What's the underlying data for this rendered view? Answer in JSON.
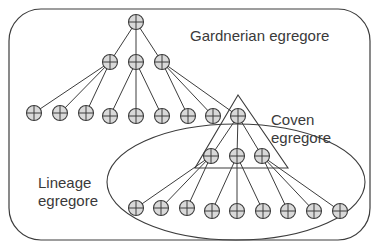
{
  "diagram": {
    "type": "nested-egregore-tree",
    "colors": {
      "stroke": "#3c3c3c",
      "node_fill": "#d9d9d9",
      "text": "#3a3a3a",
      "background": "#ffffff"
    },
    "labels": {
      "gardnerian": "Gardnerian egregore",
      "coven_line1": "Coven",
      "coven_line2": "egregore",
      "lineage_line1": "Lineage",
      "lineage_line2": "egregore"
    },
    "node_icon": "circle-plus-icon",
    "outer_box": {
      "x": 9,
      "y": 9,
      "width": 361,
      "height": 231,
      "radius": 32
    },
    "coven_triangle": {
      "apex": [
        238,
        95
      ],
      "base_left": [
        195,
        168
      ],
      "base_right": [
        288,
        168
      ]
    },
    "lineage_ellipse": {
      "cx": 236,
      "cy": 182,
      "rx": 129,
      "ry": 58
    },
    "nodes": [
      {
        "id": "root",
        "x": 136,
        "y": 22
      },
      {
        "id": "l1a",
        "x": 110,
        "y": 62
      },
      {
        "id": "l1b",
        "x": 136,
        "y": 62
      },
      {
        "id": "l1c",
        "x": 162,
        "y": 62
      },
      {
        "id": "l2a",
        "x": 34,
        "y": 113
      },
      {
        "id": "l2b",
        "x": 60,
        "y": 113
      },
      {
        "id": "l2c",
        "x": 86,
        "y": 113
      },
      {
        "id": "l2d",
        "x": 110,
        "y": 116
      },
      {
        "id": "l2e",
        "x": 136,
        "y": 116
      },
      {
        "id": "l2f",
        "x": 162,
        "y": 116
      },
      {
        "id": "l2g",
        "x": 188,
        "y": 116
      },
      {
        "id": "l2h",
        "x": 213,
        "y": 116
      },
      {
        "id": "coven_root",
        "x": 238,
        "y": 116
      },
      {
        "id": "c1",
        "x": 211,
        "y": 156
      },
      {
        "id": "c2",
        "x": 237,
        "y": 156
      },
      {
        "id": "c3",
        "x": 262,
        "y": 156
      },
      {
        "id": "n1",
        "x": 136,
        "y": 208
      },
      {
        "id": "n2",
        "x": 161,
        "y": 208
      },
      {
        "id": "n3",
        "x": 187,
        "y": 208
      },
      {
        "id": "n4",
        "x": 212,
        "y": 211
      },
      {
        "id": "n5",
        "x": 237,
        "y": 211
      },
      {
        "id": "n6",
        "x": 263,
        "y": 211
      },
      {
        "id": "n7",
        "x": 288,
        "y": 211
      },
      {
        "id": "n8",
        "x": 314,
        "y": 211
      },
      {
        "id": "n9",
        "x": 340,
        "y": 211
      }
    ],
    "edges": [
      [
        "root",
        "l1a"
      ],
      [
        "root",
        "l1b"
      ],
      [
        "root",
        "l1c"
      ],
      [
        "l1a",
        "l2a"
      ],
      [
        "l1a",
        "l2b"
      ],
      [
        "l1a",
        "l2c"
      ],
      [
        "l1b",
        "l2d"
      ],
      [
        "l1b",
        "l2e"
      ],
      [
        "l1b",
        "l2f"
      ],
      [
        "l1c",
        "l2g"
      ],
      [
        "l1c",
        "l2h"
      ],
      [
        "l1c",
        "coven_root"
      ],
      [
        "coven_root",
        "c1"
      ],
      [
        "coven_root",
        "c2"
      ],
      [
        "coven_root",
        "c3"
      ],
      [
        "c1",
        "n1"
      ],
      [
        "c1",
        "n2"
      ],
      [
        "c1",
        "n3"
      ],
      [
        "c2",
        "n4"
      ],
      [
        "c2",
        "n5"
      ],
      [
        "c2",
        "n6"
      ],
      [
        "c3",
        "n7"
      ],
      [
        "c3",
        "n8"
      ],
      [
        "c3",
        "n9"
      ]
    ]
  }
}
